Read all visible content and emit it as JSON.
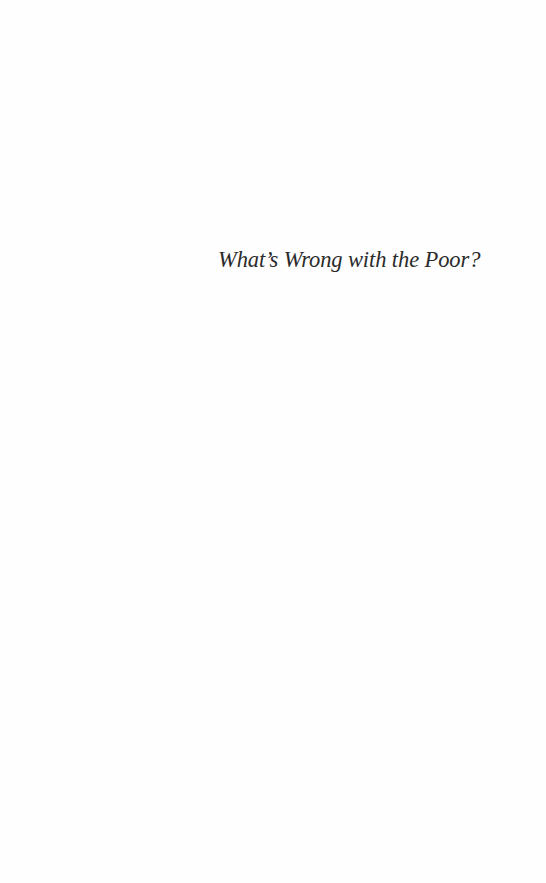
{
  "page": {
    "type": "half-title",
    "title": "What’s Wrong with the Poor?",
    "background_color": "#fefefe",
    "text_color": "#2b2b2b"
  }
}
